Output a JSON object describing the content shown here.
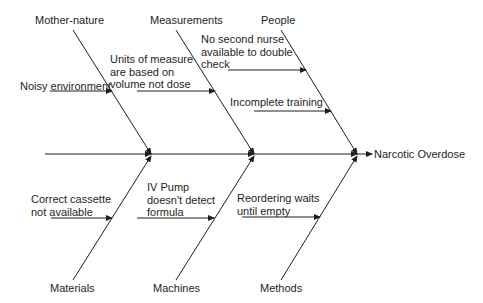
{
  "diagram": {
    "type": "fishbone",
    "effect": "Narcotic Overdose",
    "categories": {
      "mother_nature": {
        "label": "Mother-nature",
        "causes": [
          "Noisy environment"
        ]
      },
      "measurements": {
        "label": "Measurements",
        "causes": [
          [
            "Units of measure",
            "are based on",
            "volume not dose"
          ]
        ]
      },
      "people": {
        "label": "People",
        "causes": [
          [
            "No second nurse",
            "available to double",
            "check"
          ],
          "Incomplete training"
        ]
      },
      "materials": {
        "label": "Materials",
        "causes": [
          [
            "Correct cassette",
            "not available"
          ]
        ]
      },
      "machines": {
        "label": "Machines",
        "causes": [
          [
            "IV Pump",
            "doesn't detect",
            "formula"
          ]
        ]
      },
      "methods": {
        "label": "Methods",
        "causes": [
          [
            "Reordering waits",
            "until empty"
          ]
        ]
      }
    },
    "line_color": "#1e1e1e"
  }
}
